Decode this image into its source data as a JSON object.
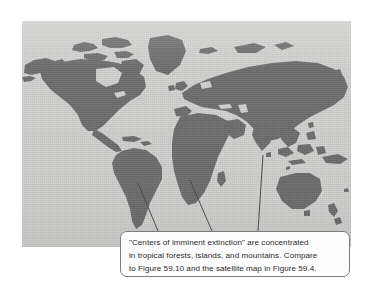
{
  "figure": {
    "kind": "world-map-figure",
    "caption_text": "\"Centers of imminent extinction\" are concentrated\nin tropical forests, islands, and mountains. Compare\nto Figure 59.10 and the satellite map in Figure 59.4.",
    "caption_lines": [
      "\"Centers of imminent extinction\" are concentrated",
      "in tropical forests, islands, and mountains. Compare",
      "to Figure 59.10 and the satellite map in Figure 59.4."
    ],
    "referenced_figures": [
      "Figure 59.10",
      "Figure 59.4"
    ],
    "leader_targets": [
      "tropical-forests-south-america",
      "tropical-forests-africa",
      "islands-southeast-asia"
    ]
  },
  "colors": {
    "page_background": "#ffffff",
    "ocean_background": "#d2d2d0",
    "land_fill": "#6e6e6e",
    "callout_fill": "#fdfdfd",
    "callout_border": "#7d7d7d",
    "leader_line": "#4a4a4a",
    "caption_text": "#2b2b2b"
  },
  "map": {
    "projection_note": "world map, landmasses silhouetted in dark gray",
    "regions": [
      "north-america",
      "greenland",
      "south-america",
      "europe",
      "africa",
      "asia",
      "australia",
      "new-zealand",
      "indonesia",
      "japan",
      "madagascar",
      "british-isles"
    ]
  }
}
